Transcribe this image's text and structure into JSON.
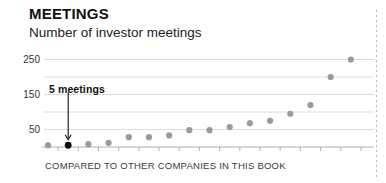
{
  "header": {
    "title": "MEETINGS",
    "subtitle": "Number of investor meetings"
  },
  "caption": "COMPARED TO OTHER COMPANIES IN THIS BOOK",
  "annotation": {
    "label": "5 meetings",
    "points_to_index": 1
  },
  "colors": {
    "title": "#111111",
    "subtitle": "#222222",
    "dot": "#9a9a9a",
    "dot_highlight": "#111111",
    "gridline": "#dcdcdc",
    "axis": "#b0b0b0",
    "caption": "#3a3a3a",
    "divider": "#b9b9b9"
  },
  "chart_data": {
    "type": "scatter",
    "title": "MEETINGS",
    "subtitle": "Number of investor meetings",
    "xlabel": "COMPARED TO OTHER COMPANIES IN THIS BOOK",
    "ylabel": "",
    "ylim": [
      0,
      260
    ],
    "yticks": [
      50,
      150,
      250
    ],
    "ytick_labels": [
      "50",
      "150",
      "250"
    ],
    "gridlines": [
      50,
      100,
      150,
      200,
      250
    ],
    "grid": true,
    "legend": false,
    "x_tick_count": 16,
    "x": [
      1,
      2,
      3,
      4,
      5,
      6,
      7,
      8,
      9,
      10,
      11,
      12,
      13,
      14,
      15,
      16
    ],
    "values": [
      5,
      5,
      8,
      12,
      28,
      28,
      33,
      48,
      48,
      57,
      68,
      75,
      95,
      120,
      200,
      250
    ],
    "highlight_index": 1,
    "annotations": [
      {
        "text": "5 meetings",
        "x_index": 1,
        "y": 5
      }
    ]
  }
}
